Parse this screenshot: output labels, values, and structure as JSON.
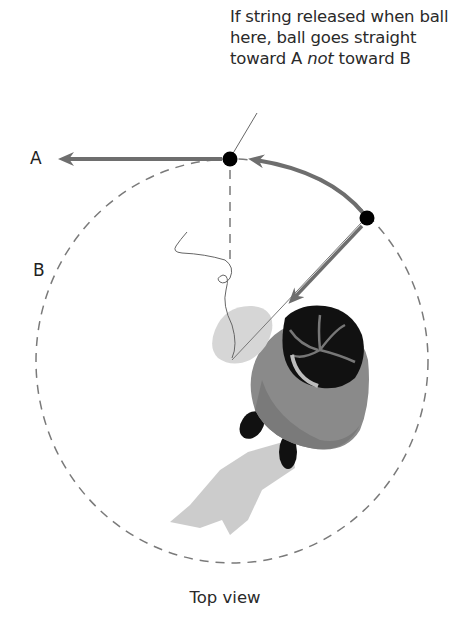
{
  "caption": {
    "line1": "If string released when ball",
    "line2": "here, ball goes straight",
    "line3_pre": "toward A ",
    "line3_em": "not",
    "line3_post": " toward B"
  },
  "labels": {
    "a": "A",
    "b": "B"
  },
  "footer": "Top view",
  "colors": {
    "arrow": "#6e6e6e",
    "path_dashed": "#7a7a7a",
    "ball": "#000000",
    "shadow": "#c8c8c8",
    "hat": "#111111",
    "coat": "#8a8a8a",
    "glove": "#d8d8d8"
  }
}
